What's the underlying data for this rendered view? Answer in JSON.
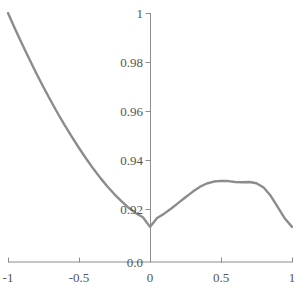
{
  "chart_data": {
    "type": "line",
    "title": "",
    "xlabel": "",
    "ylabel": "",
    "xlim": [
      -1,
      1
    ],
    "ylim": [
      0.9105,
      1.0
    ],
    "grid": false,
    "legend": null,
    "series": [
      {
        "name": "curve",
        "color": "#8c8c8c",
        "line_width": 2.4,
        "x": [
          -1.0,
          -0.95,
          -0.9,
          -0.85,
          -0.8,
          -0.75,
          -0.7,
          -0.65,
          -0.6,
          -0.55,
          -0.5,
          -0.45,
          -0.4,
          -0.35,
          -0.3,
          -0.25,
          -0.2,
          -0.15,
          -0.1,
          -0.05,
          0.0,
          0.05,
          0.1,
          0.15,
          0.2,
          0.25,
          0.3,
          0.35,
          0.4,
          0.45,
          0.5,
          0.55,
          0.6,
          0.65,
          0.7,
          0.75,
          0.8,
          0.85,
          0.9,
          0.95,
          1.0
        ],
        "y": [
          1.0,
          0.9935,
          0.9872,
          0.9812,
          0.9753,
          0.9697,
          0.9643,
          0.9591,
          0.9541,
          0.9494,
          0.9449,
          0.9406,
          0.9365,
          0.9327,
          0.9292,
          0.926,
          0.9231,
          0.9205,
          0.9183,
          0.9166,
          0.9127,
          0.9163,
          0.9181,
          0.9202,
          0.9225,
          0.9248,
          0.927,
          0.929,
          0.9304,
          0.9312,
          0.9315,
          0.9314,
          0.931,
          0.9309,
          0.931,
          0.9305,
          0.9288,
          0.9254,
          0.9208,
          0.9161,
          0.9127
        ]
      }
    ],
    "x_ticks": [
      {
        "value": -1,
        "label": "-1"
      },
      {
        "value": -0.5,
        "label": "-0.5"
      },
      {
        "value": 0,
        "label": "0"
      },
      {
        "value": 0.5,
        "label": "0.5"
      },
      {
        "value": 1,
        "label": "1"
      }
    ],
    "y_ticks": [
      {
        "value": 1.0,
        "label": "1"
      },
      {
        "value": 0.98,
        "label": "0.98"
      },
      {
        "value": 0.96,
        "label": "0.96"
      },
      {
        "value": 0.94,
        "label": "0.94"
      },
      {
        "value": 0.92,
        "label": "0.92"
      },
      {
        "value": 0.9105,
        "label": "0.0"
      }
    ],
    "annotations": [
      {
        "label": "minimum",
        "x": 0.0,
        "y": 0.9127
      },
      {
        "label": "local maximum",
        "x": 0.7,
        "y": 0.9315
      },
      {
        "label": "left endpoint",
        "x": -1.0,
        "y": 1.0
      },
      {
        "label": "right endpoint",
        "x": 1.0,
        "y": 0.9127
      }
    ],
    "axis_color": "#8c8c8c",
    "text_color": "#555555"
  },
  "geometry": {
    "x_px_min": 8,
    "x_px_max": 292,
    "y_px_top": 13,
    "y_px_axis": 262,
    "y_axis_x_px": 150,
    "y_px_per_unit": 2450
  },
  "y_tick_pixels": [
    13,
    62,
    111,
    160,
    209,
    262
  ],
  "x_tick_pixels": [
    8,
    79,
    150,
    221,
    292
  ]
}
